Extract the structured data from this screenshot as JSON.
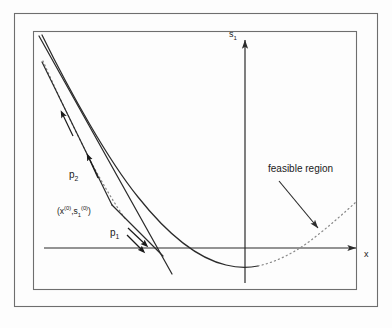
{
  "figure": {
    "kind": "math-diagram",
    "background_color": "#fdfdfd",
    "stroke_color": "#2b2b2b",
    "frame": {
      "outer_label": "outer-border",
      "inner_label": "inner-border"
    },
    "axes": {
      "x_axis_label": "x",
      "y_axis_label_base": "s",
      "y_axis_label_sub": "1",
      "y_axis_label": "s₁",
      "origin_px": [
        245,
        248
      ],
      "x_axis_from_px": [
        44,
        248
      ],
      "x_axis_to_px": [
        358,
        248
      ],
      "y_axis_from_px": [
        245,
        283
      ],
      "y_axis_to_px": [
        245,
        38
      ]
    },
    "annotations": {
      "feasible_region": "feasible region",
      "point_label": "(x⁽⁰⁾,s₁⁽⁰⁾)",
      "point_label_parts": {
        "open": "(",
        "x_base": "x",
        "x_sup": "(0)",
        "comma": ",",
        "s_base": "s",
        "s_sub": "1",
        "s_sup": "(0)",
        "close": ")"
      },
      "direction_1": "p",
      "direction_1_sub": "1",
      "direction_1_label": "p₁",
      "direction_2": "p",
      "direction_2_sub": "2",
      "direction_2_label": "p₂"
    },
    "curves": {
      "parabola_solid_note": "solid portion of the quadratic constraint curve",
      "parabola_dotted_note": "dotted portion marking the feasible region boundary",
      "tangent_line_note": "tangent / linearization line through the iterate",
      "search_direction_note": "two search direction segments from the current iterate"
    }
  }
}
